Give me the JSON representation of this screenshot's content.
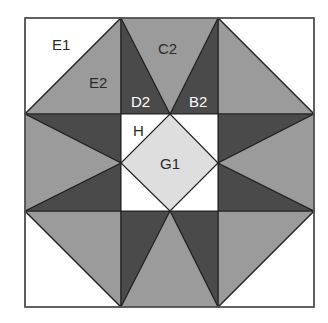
{
  "diagram": {
    "type": "quilt-block",
    "grid": {
      "rows": 3,
      "cols": 3
    },
    "colors": {
      "white": "#ffffff",
      "medium": "#9b9b9b",
      "dark": "#4a4a4a",
      "light": "#dedede",
      "line": "#222222"
    },
    "labels": {
      "e1": "E1",
      "e2": "E2",
      "c2": "C2",
      "d2": "D2",
      "b2": "B2",
      "h": "H",
      "g1": "G1"
    }
  }
}
